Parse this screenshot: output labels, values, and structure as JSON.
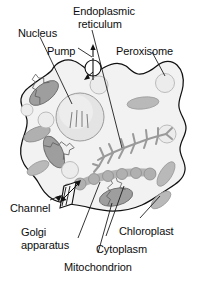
{
  "figure": {
    "kind": "cell-diagram",
    "background_color": "#ffffff",
    "outline_color": "#111111",
    "cytoplasm_fill": "#f2f2f2",
    "text_color": "#0d0d0d"
  },
  "labels": [
    {
      "id": "nucleus",
      "text": "Nucleus",
      "x": 18,
      "y": 27
    },
    {
      "id": "endoplasmic",
      "text": "Endoplasmic",
      "x": 73,
      "y": 5
    },
    {
      "id": "reticulum",
      "text": "reticulum",
      "x": 78,
      "y": 18
    },
    {
      "id": "pump",
      "text": "Pump",
      "x": 47,
      "y": 45
    },
    {
      "id": "peroxisome",
      "text": "Peroxisome",
      "x": 116,
      "y": 45
    },
    {
      "id": "channel",
      "text": "Channel",
      "x": 10,
      "y": 202
    },
    {
      "id": "golgi",
      "text": "Golgi",
      "x": 21,
      "y": 226
    },
    {
      "id": "apparatus",
      "text": "apparatus",
      "x": 21,
      "y": 239
    },
    {
      "id": "chloroplast",
      "text": "Chloroplast",
      "x": 119,
      "y": 225
    },
    {
      "id": "cytoplasm",
      "text": "Cytoplasm",
      "x": 96,
      "y": 243
    },
    {
      "id": "mitochondrion",
      "text": "Mitochondrion",
      "x": 64,
      "y": 261
    }
  ],
  "organelles": {
    "nucleus": {
      "count": 1,
      "fill": "#e4e4e4",
      "stroke": "#9a9a9a"
    },
    "mitochondria": {
      "count": 4,
      "fill": "#9e9e9e",
      "stroke": "#6f6f6f"
    },
    "peroxisomes": {
      "count": 5,
      "fill": "#ececec",
      "stroke": "#b5b5b5"
    },
    "chloroplasts": {
      "count": 4,
      "fill": "#b9b9b9",
      "stroke": "#9a9a9a"
    },
    "golgi": {
      "count": 1,
      "fill": "#b3b3b3",
      "stroke": "#8e8e8e"
    },
    "endoplasmic_reticulum": {
      "count": 1,
      "stroke": "#9a9a9a"
    },
    "pump": {
      "count": 1,
      "symbol": "circle-with-vertical-bar"
    },
    "channel": {
      "count": 1,
      "symbol": "parallelogram-with-double-arrow"
    }
  }
}
